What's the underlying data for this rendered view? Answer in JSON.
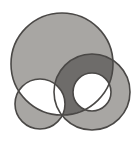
{
  "figure": {
    "canvas": {
      "width": 138,
      "height": 141
    },
    "colors": {
      "background": "#ffffff",
      "fill": "#a8a6a3",
      "fill_overlap_dark": "#6e6c6a",
      "stroke": "#4a4846"
    },
    "stroke_width": 1.6,
    "fill_rule": "evenodd",
    "shapes": [
      {
        "name": "large-circle",
        "type": "circle",
        "cx": 62,
        "cy": 64,
        "r": 51,
        "filled": true
      },
      {
        "name": "small-circle",
        "type": "circle",
        "cx": 40,
        "cy": 104,
        "r": 25,
        "filled": true
      },
      {
        "name": "ring-outer-circle",
        "type": "circle",
        "cx": 92,
        "cy": 92,
        "r": 38,
        "filled": true
      },
      {
        "name": "ring-inner-hole",
        "type": "circle",
        "cx": 92,
        "cy": 92,
        "r": 19,
        "filled": false
      }
    ],
    "dark_overlap_regions": [
      {
        "name": "triple-overlap-lens",
        "description": "lens where large circle, ring band and small circle region coincide"
      }
    ]
  }
}
